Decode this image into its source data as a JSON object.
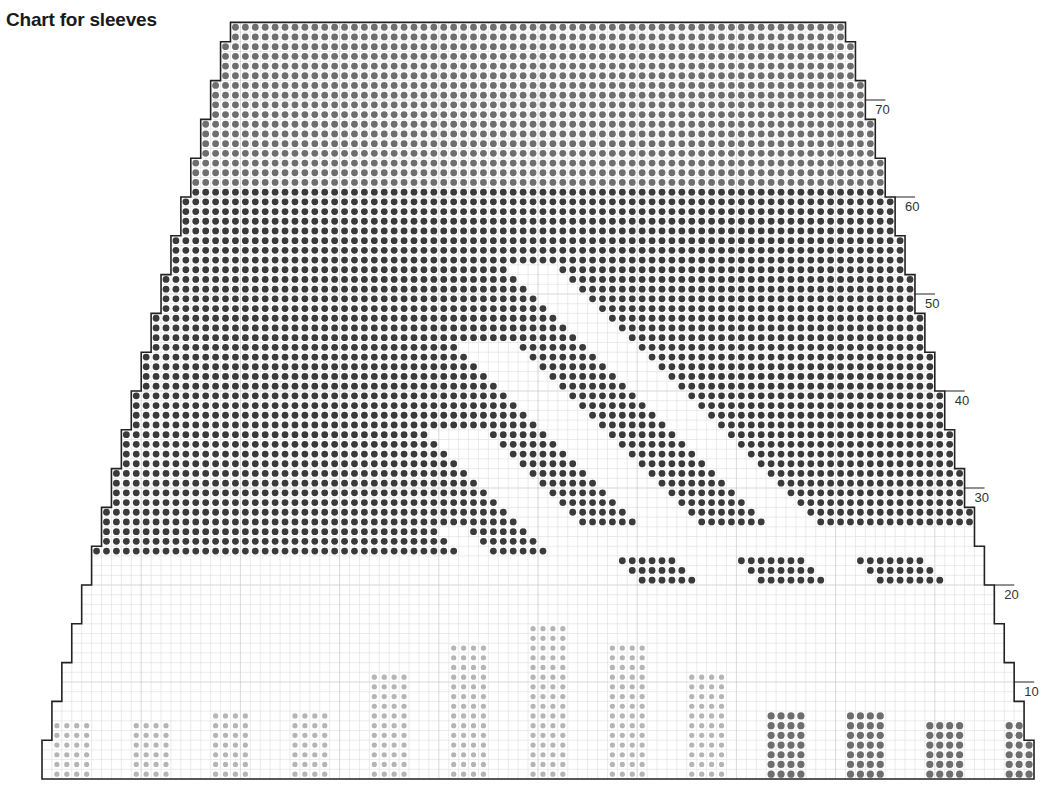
{
  "title": "Chart for sleeves",
  "colors": {
    "outline": "#222222",
    "grid_minor": "#dddddd",
    "grid_major": "#bdbdbd",
    "dot_dark": "#3a3a3a",
    "dot_medium": "#6e6e6e",
    "dot_light": "#b5b5b5",
    "background": "#ffffff"
  },
  "grid": {
    "origin_x": 42,
    "bottom_y": 779,
    "cell_w": 9.92,
    "cell_h": 9.7,
    "total_cols": 100,
    "total_rows": 78,
    "major_every": 10,
    "shaping": "decrease 1 stitch each side every 4 rows"
  },
  "row_labels": [
    {
      "row": 10,
      "text": "10"
    },
    {
      "row": 20,
      "text": "20"
    },
    {
      "row": 30,
      "text": "30"
    },
    {
      "row": 40,
      "text": "40"
    },
    {
      "row": 50,
      "text": "50"
    },
    {
      "row": 60,
      "text": "60"
    },
    {
      "row": 70,
      "text": "70"
    }
  ],
  "motifs": {
    "yoke": {
      "from_row": 24,
      "shade_top_from_row": 62,
      "description": "solid dot fill above row 24 with diagonal white stripes"
    },
    "diagonal_stripes": [
      {
        "u_start": 66,
        "u_end": 68,
        "row_min": 24,
        "row_max": 26
      },
      {
        "u_start": 75,
        "u_end": 80,
        "row_min": 21,
        "row_max": 36
      },
      {
        "u_start": 87,
        "u_end": 92,
        "row_min": 21,
        "row_max": 45
      },
      {
        "u_start": 100,
        "u_end": 104,
        "row_min": 21,
        "row_max": 53
      }
    ],
    "lower_blocks": [
      {
        "col": 1,
        "width": 4,
        "height": 6,
        "shade": "light"
      },
      {
        "col": 9,
        "width": 4,
        "height": 6,
        "shade": "light"
      },
      {
        "col": 17,
        "width": 4,
        "height": 7,
        "shade": "light"
      },
      {
        "col": 25,
        "width": 4,
        "height": 7,
        "shade": "light"
      },
      {
        "col": 33,
        "width": 4,
        "height": 11,
        "shade": "light"
      },
      {
        "col": 41,
        "width": 4,
        "height": 14,
        "shade": "light"
      },
      {
        "col": 49,
        "width": 4,
        "height": 16,
        "shade": "light"
      },
      {
        "col": 57,
        "width": 4,
        "height": 14,
        "shade": "light"
      },
      {
        "col": 65,
        "width": 4,
        "height": 11,
        "shade": "light"
      },
      {
        "col": 73,
        "width": 4,
        "height": 7,
        "shade": "dark"
      },
      {
        "col": 81,
        "width": 4,
        "height": 7,
        "shade": "dark"
      },
      {
        "col": 89,
        "width": 4,
        "height": 6,
        "shade": "dark"
      },
      {
        "col": 97,
        "width": 3,
        "height": 6,
        "shade": "dark"
      }
    ]
  }
}
